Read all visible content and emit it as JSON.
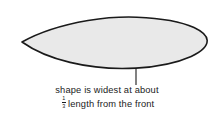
{
  "figure": {
    "background_color": "#ffffff"
  },
  "shape": {
    "name": "airfoil-teardrop-outline",
    "fill_color": "#e9e9e9",
    "stroke_color": "#1a1a1a",
    "stroke_width": 1.6,
    "leading_edge_point": [
      22,
      42
    ],
    "trailing_edge_point": [
      207,
      40
    ],
    "top_peak": [
      125,
      17
    ],
    "bottom_extreme": [
      136,
      68
    ],
    "widest_x": 136
  },
  "leader_line": {
    "name": "leader-line-to-widest-point",
    "color": "#1a1a1a",
    "x": 136,
    "y_start": 68,
    "y_end": 85,
    "width": 1.1
  },
  "caption": {
    "line1": "shape is widest at about",
    "fraction": {
      "numerator": "1",
      "denominator": "3"
    },
    "line2_rest": "length from the front",
    "text_color": "#1b1b1b"
  }
}
